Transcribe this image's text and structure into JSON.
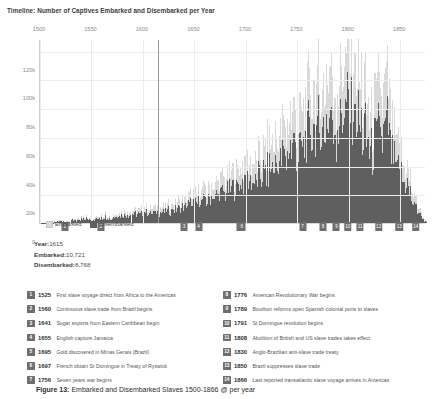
{
  "chart_title": "Timeline: Number of Captives Embarked and Disembarked per Year",
  "legend": {
    "embarked_label": "Embarked",
    "disembarked_label": "Disembarked",
    "embarked_color": "#d9d9d9",
    "disembarked_color": "#5f5f5f"
  },
  "readout": {
    "year_key": "Year:",
    "year_value": "1615",
    "embarked_key": "Embarked:",
    "embarked_value": "10,721",
    "disembarked_key": "Disembarked:",
    "disembarked_value": "8,768"
  },
  "caption": {
    "figure_label": "Figure 13:",
    "text": "Embarked and Disembarked Slaves 1500-1866 @ per year"
  },
  "events_left": [
    {
      "num": "1",
      "year": "1525",
      "text": "First slave voyage direct from Africa to the Americas"
    },
    {
      "num": "2",
      "year": "1560",
      "text": "Continuous slave trade from Brazil begins"
    },
    {
      "num": "3",
      "year": "1641",
      "text": "Sugar exports from Eastern Caribbean begin"
    },
    {
      "num": "4",
      "year": "1655",
      "text": "English capture Jamaica"
    },
    {
      "num": "5",
      "year": "1695",
      "text": "Gold discovered in Minas Gerais (Brazil)"
    },
    {
      "num": "6",
      "year": "1697",
      "text": "French obtain St Domingue in Treaty of Ryswick"
    },
    {
      "num": "7",
      "year": "1756",
      "text": "Seven years war begins"
    }
  ],
  "events_right": [
    {
      "num": "8",
      "year": "1776",
      "text": "American Revolutionary War begins"
    },
    {
      "num": "9",
      "year": "1789",
      "text": "Bourbon reforms open Spanish colonial ports to slaves"
    },
    {
      "num": "10",
      "year": "1791",
      "text": "St Domingue revolution begins"
    },
    {
      "num": "11",
      "year": "1808",
      "text": "Abolition of British and US slave trades takes effect"
    },
    {
      "num": "12",
      "year": "1830",
      "text": "Anglo-Brazilian anti-slave trade treaty"
    },
    {
      "num": "13",
      "year": "1850",
      "text": "Brazil suppresses slave trade"
    },
    {
      "num": "14",
      "year": "1866",
      "text": "Last reported transatlantic slave voyage arrives in Americas"
    }
  ],
  "chart_data": {
    "type": "bar",
    "title": "Timeline: Number of Captives Embarked and Disembarked per Year",
    "xlabel": "",
    "ylabel": "",
    "xlim": [
      1500,
      1875
    ],
    "ylim": [
      0,
      128000
    ],
    "grid": true,
    "legend_position": "below-axis-left",
    "xticks": [
      1500,
      1550,
      1600,
      1650,
      1700,
      1750,
      1800,
      1850
    ],
    "xtick_labels": [
      "1500",
      "1550",
      "1600",
      "1650",
      "1700",
      "1750",
      "1800",
      "1850"
    ],
    "yticks": [
      0,
      20000,
      40000,
      60000,
      80000,
      100000,
      120000
    ],
    "ytick_labels": [
      "0",
      "20k",
      "40k",
      "60k",
      "80k",
      "100k",
      "120k"
    ],
    "cursor_year": 1615,
    "series": [
      {
        "name": "Embarked",
        "color": "#d9d9d9"
      },
      {
        "name": "Disembarked",
        "color": "#5f5f5f"
      }
    ],
    "x": [
      1500,
      1505,
      1510,
      1515,
      1520,
      1525,
      1530,
      1535,
      1540,
      1545,
      1550,
      1555,
      1560,
      1565,
      1570,
      1575,
      1580,
      1585,
      1590,
      1595,
      1600,
      1605,
      1610,
      1615,
      1620,
      1625,
      1630,
      1635,
      1640,
      1645,
      1650,
      1655,
      1660,
      1665,
      1670,
      1675,
      1680,
      1685,
      1690,
      1695,
      1700,
      1705,
      1710,
      1715,
      1720,
      1725,
      1730,
      1735,
      1740,
      1745,
      1750,
      1755,
      1760,
      1765,
      1770,
      1775,
      1780,
      1785,
      1790,
      1795,
      1800,
      1805,
      1810,
      1815,
      1820,
      1825,
      1830,
      1835,
      1840,
      1845,
      1850,
      1855,
      1860,
      1865
    ],
    "embarked": [
      200,
      400,
      700,
      900,
      1200,
      1600,
      2000,
      2400,
      2800,
      3100,
      3500,
      4000,
      4600,
      5200,
      6000,
      6800,
      7500,
      8200,
      9000,
      9800,
      10300,
      10500,
      10700,
      10721,
      11500,
      13000,
      14500,
      16000,
      18500,
      20000,
      21500,
      23000,
      25000,
      27500,
      29000,
      31000,
      33500,
      36000,
      38000,
      40000,
      42000,
      45000,
      48000,
      52000,
      56000,
      60000,
      66000,
      70000,
      74000,
      78000,
      82000,
      88000,
      92000,
      96000,
      100000,
      104000,
      96000,
      100000,
      108000,
      112000,
      104000,
      96000,
      88000,
      76000,
      88000,
      96000,
      104000,
      64000,
      52000,
      44000,
      36000,
      20000,
      10000,
      2000
    ],
    "disembarked": [
      170,
      340,
      590,
      760,
      1010,
      1340,
      1680,
      2010,
      2350,
      2600,
      2940,
      3360,
      3870,
      4370,
      5040,
      5710,
      6300,
      6890,
      7560,
      8230,
      8650,
      8820,
      8990,
      8768,
      9660,
      10920,
      12180,
      13440,
      15540,
      16800,
      18060,
      19320,
      21000,
      23100,
      24360,
      26040,
      28140,
      30240,
      31920,
      33600,
      35280,
      37800,
      40320,
      43680,
      47040,
      50400,
      55440,
      58800,
      62160,
      65520,
      68880,
      73920,
      77280,
      80640,
      84000,
      87360,
      80640,
      84000,
      90720,
      94080,
      87360,
      80640,
      73920,
      63840,
      73920,
      80640,
      87360,
      53760,
      43680,
      36960,
      30240,
      16800,
      8400,
      1680
    ]
  },
  "markers": [
    {
      "num": "1",
      "year": 1525
    },
    {
      "num": "2",
      "year": 1560
    },
    {
      "num": "3",
      "year": 1641
    },
    {
      "num": "4",
      "year": 1655
    },
    {
      "num": "5",
      "year": 1695
    },
    {
      "num": "6",
      "year": 1697
    },
    {
      "num": "7",
      "year": 1756
    },
    {
      "num": "8",
      "year": 1776
    },
    {
      "num": "9",
      "year": 1789
    },
    {
      "num": "10",
      "year": 1800
    },
    {
      "num": "11",
      "year": 1812
    },
    {
      "num": "12",
      "year": 1830
    },
    {
      "num": "13",
      "year": 1850
    },
    {
      "num": "14",
      "year": 1866
    }
  ]
}
